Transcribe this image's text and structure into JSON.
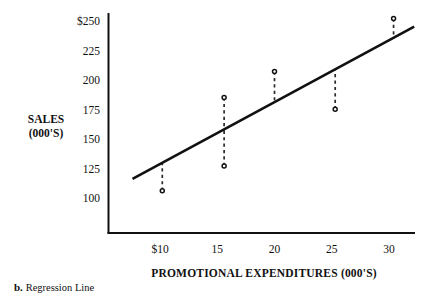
{
  "caption": {
    "marker": "b.",
    "text": "Regression Line"
  },
  "chart_data": {
    "type": "scatter",
    "title": "",
    "xlabel": "PROMOTIONAL EXPENDITURES (000'S)",
    "ylabel_line1": "SALES",
    "ylabel_line2": "(000'S)",
    "xlim": [
      7.0,
      32.8
    ],
    "ylim": [
      88,
      256
    ],
    "grid": false,
    "legend": "none",
    "xticks": [
      10,
      15,
      20,
      25,
      30
    ],
    "xticklabels": [
      "$10",
      "15",
      "20",
      "25",
      "30"
    ],
    "yticks": [
      100,
      125,
      150,
      175,
      200,
      225,
      250
    ],
    "yticklabels": [
      "100",
      "125",
      "150",
      "175",
      "200",
      "225",
      "$250"
    ],
    "points": [
      {
        "x": 10.2,
        "y": 107
      },
      {
        "x": 15.6,
        "y": 186
      },
      {
        "x": 15.6,
        "y": 128
      },
      {
        "x": 20.0,
        "y": 208
      },
      {
        "x": 25.3,
        "y": 176
      },
      {
        "x": 30.4,
        "y": 253
      }
    ],
    "residual_connectors": [
      {
        "x": 10.2,
        "y_point": 107,
        "y_line": 130
      },
      {
        "x": 15.6,
        "y_point": 186,
        "y_line": 158
      },
      {
        "x": 15.6,
        "y_point": 128,
        "y_line": 158
      },
      {
        "x": 20.0,
        "y_point": 208,
        "y_line": 181
      },
      {
        "x": 25.3,
        "y_point": 176,
        "y_line": 209
      },
      {
        "x": 30.4,
        "y_point": 253,
        "y_line": 236
      }
    ],
    "series": [
      {
        "name": "Regression Line",
        "type": "line",
        "x": [
          7.6,
          32.2
        ],
        "values": [
          117,
          246
        ]
      }
    ]
  }
}
